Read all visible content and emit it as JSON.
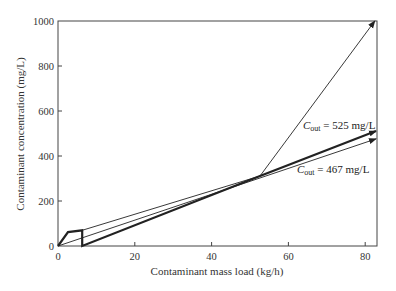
{
  "chart_data": {
    "type": "line",
    "title": "",
    "xlabel": "Contaminant mass load (kg/h)",
    "ylabel": "Contaminant concentration (mg/L)",
    "xlim": [
      0,
      83
    ],
    "ylim": [
      0,
      1000
    ],
    "xticks": [
      0,
      20,
      40,
      60,
      80
    ],
    "yticks": [
      0,
      200,
      400,
      600,
      800,
      1000
    ],
    "grid": false,
    "legend": null,
    "series": [
      {
        "name": "Composite curve (thick)",
        "style": "thick",
        "arrow": true,
        "points": [
          [
            0,
            0
          ],
          [
            2.6,
            62
          ],
          [
            6.3,
            70
          ],
          [
            6.3,
            0
          ],
          [
            52.6,
            311
          ],
          [
            82.8,
            511
          ]
        ]
      },
      {
        "name": "Supply line Cout = 467 mg/L",
        "style": "thin",
        "arrow": true,
        "points": [
          [
            0,
            0
          ],
          [
            82.8,
            476
          ]
        ]
      },
      {
        "name": "Thin line from step",
        "style": "thin",
        "arrow": false,
        "points": [
          [
            6.3,
            70
          ],
          [
            52.6,
            311
          ]
        ]
      },
      {
        "name": "Steep line",
        "style": "thin",
        "arrow": true,
        "points": [
          [
            52.6,
            311
          ],
          [
            82.5,
            1000
          ]
        ]
      }
    ],
    "annotations": [
      {
        "text_main": "C",
        "text_sub": "out",
        "text_rest": " = 525 mg/L",
        "x": 64,
        "y": 530
      },
      {
        "text_main": "C",
        "text_sub": "out",
        "text_rest": " = 467 mg/L",
        "x": 64,
        "y": 335
      }
    ]
  },
  "labels": {
    "xlabel": "Contaminant mass load (kg/h)",
    "ylabel": "Contaminant concentration (mg/L)",
    "annot1_main": "C",
    "annot1_sub": "out",
    "annot1_rest": " = 525 mg/L",
    "annot2_main": "C",
    "annot2_sub": "out",
    "annot2_rest": " = 467 mg/L",
    "xticks": [
      "0",
      "20",
      "40",
      "60",
      "80"
    ],
    "yticks": [
      "0",
      "200",
      "400",
      "600",
      "800",
      "1000"
    ]
  }
}
